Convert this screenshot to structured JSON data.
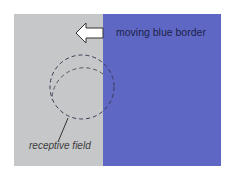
{
  "diagram": {
    "labels": {
      "moving_border": "moving blue border",
      "receptive_field": "receptive field"
    },
    "colors": {
      "gray_region": "#c6c7c9",
      "blue_region": "#5e68c4",
      "arrow_fill": "#ffffff",
      "arrow_stroke": "#333333",
      "circle_stroke": "#3a3a55"
    },
    "arrow": {
      "direction": "left"
    },
    "circle": {
      "style": "dashed",
      "cx": 82,
      "cy": 87,
      "r": 32
    }
  }
}
